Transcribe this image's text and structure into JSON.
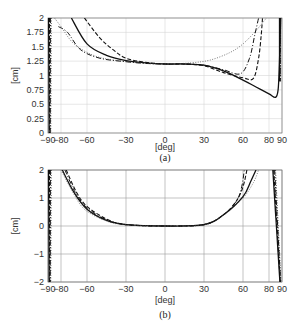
{
  "chart_data": [
    {
      "id": "a",
      "type": "line",
      "caption": "(a)",
      "xlabel": "[deg]",
      "ylabel": "[cm]",
      "xlim": [
        -90,
        90
      ],
      "ylim": [
        0,
        2
      ],
      "xticks": [
        -90,
        -80,
        -60,
        -30,
        0,
        30,
        60,
        80,
        90
      ],
      "yticks": [
        0,
        0.25,
        0.5,
        0.75,
        1,
        1.25,
        1.5,
        1.75,
        2
      ],
      "xtick_labels": [
        "−90",
        "−80",
        "−60",
        "−30",
        "0",
        "30",
        "60",
        "80",
        "90"
      ],
      "ytick_labels": [
        "0",
        "0.25",
        "0.5",
        "0.75",
        "1",
        "1.25",
        "1.5",
        "1.75",
        "2"
      ],
      "grid": true,
      "legend": null,
      "series": [
        {
          "name": "solid",
          "style": "solid",
          "x": [
            -72,
            -60,
            -45,
            -30,
            -15,
            0,
            15,
            30,
            45,
            60,
            70,
            80,
            85,
            87,
            88,
            89
          ],
          "values": [
            2.0,
            1.55,
            1.35,
            1.26,
            1.22,
            1.2,
            1.2,
            1.18,
            1.08,
            0.92,
            0.8,
            0.68,
            0.62,
            0.75,
            1.2,
            2.0
          ]
        },
        {
          "name": "dashed",
          "style": "dashed",
          "x": [
            -62,
            -50,
            -40,
            -30,
            -15,
            0,
            15,
            30,
            45,
            60,
            68,
            72,
            74,
            75
          ],
          "values": [
            2.0,
            1.65,
            1.45,
            1.3,
            1.23,
            1.2,
            1.2,
            1.17,
            1.05,
            0.96,
            0.95,
            1.3,
            1.7,
            2.0
          ]
        },
        {
          "name": "dash-dot",
          "style": "dashdot",
          "x": [
            -82,
            -75,
            -65,
            -50,
            -30,
            -15,
            0,
            15,
            30,
            45,
            58,
            65,
            69,
            72
          ],
          "values": [
            1.85,
            1.75,
            1.45,
            1.3,
            1.24,
            1.21,
            1.2,
            1.2,
            1.18,
            1.1,
            1.03,
            1.3,
            1.7,
            2.0
          ]
        },
        {
          "name": "dotted",
          "style": "dotted",
          "x": [
            -85,
            -80,
            -70,
            -55,
            -40,
            -20,
            0,
            20,
            35,
            50,
            60,
            70,
            78
          ],
          "values": [
            2.0,
            1.85,
            1.55,
            1.35,
            1.27,
            1.22,
            1.2,
            1.22,
            1.27,
            1.4,
            1.55,
            1.78,
            2.0
          ]
        }
      ]
    },
    {
      "id": "b",
      "type": "line",
      "caption": "(b)",
      "xlabel": "[deg]",
      "ylabel": "[cm]",
      "xlim": [
        -90,
        90
      ],
      "ylim": [
        -2,
        2
      ],
      "xticks": [
        -90,
        -80,
        -60,
        -30,
        0,
        30,
        60,
        80,
        90
      ],
      "yticks": [
        -2,
        -1,
        0,
        1,
        2
      ],
      "xtick_labels": [
        "−90",
        "−80",
        "−60",
        "−30",
        "0",
        "30",
        "60",
        "80",
        "90"
      ],
      "ytick_labels": [
        "−2",
        "−1",
        "0",
        "1",
        "2"
      ],
      "grid": true,
      "legend": null,
      "series": [
        {
          "name": "solid",
          "style": "solid",
          "x": [
            -79,
            -70,
            -60,
            -45,
            -30,
            0,
            30,
            45,
            60,
            66,
            70
          ],
          "values": [
            2.0,
            1.2,
            0.6,
            0.2,
            0.05,
            0.0,
            0.05,
            0.4,
            1.05,
            1.6,
            2.0
          ]
        },
        {
          "name": "dashed",
          "style": "dashed",
          "x": [
            -76,
            -68,
            -60,
            -45,
            -30,
            0,
            30,
            45,
            55,
            60,
            63
          ],
          "values": [
            2.0,
            1.2,
            0.7,
            0.25,
            0.05,
            0.0,
            0.05,
            0.4,
            0.9,
            1.4,
            2.0
          ]
        },
        {
          "name": "dash-dot",
          "style": "dashdot",
          "x": [
            -77,
            -69,
            -60,
            -45,
            -30,
            0,
            30,
            45,
            55,
            59,
            61
          ],
          "values": [
            2.0,
            1.2,
            0.65,
            0.22,
            0.05,
            0.0,
            0.05,
            0.4,
            0.9,
            1.4,
            2.0
          ]
        },
        {
          "name": "dotted",
          "style": "dotted",
          "x": [
            -80,
            -72,
            -62,
            -45,
            -30,
            0,
            30,
            45,
            60,
            68,
            72
          ],
          "values": [
            2.0,
            1.3,
            0.6,
            0.18,
            0.04,
            0.0,
            0.04,
            0.38,
            1.0,
            1.55,
            2.0
          ]
        }
      ]
    }
  ]
}
